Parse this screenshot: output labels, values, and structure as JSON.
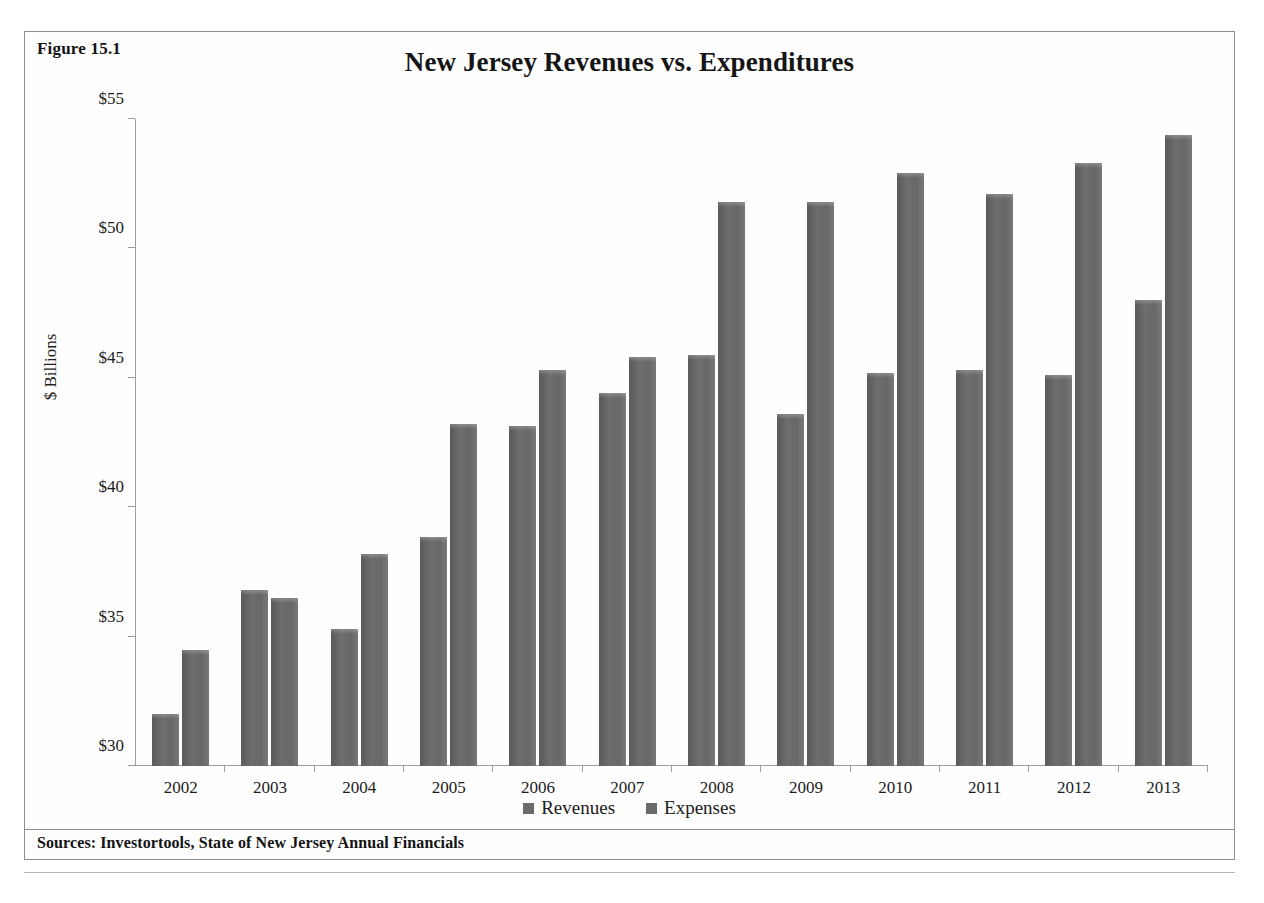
{
  "figure": {
    "label": "Figure 15.1",
    "source_note": "Sources: Investortools, State of New Jersey Annual Financials"
  },
  "chart_data": {
    "type": "bar",
    "title": "New Jersey Revenues vs. Expenditures",
    "xlabel": "",
    "ylabel": "$ Billions",
    "categories": [
      "2002",
      "2003",
      "2004",
      "2005",
      "2006",
      "2007",
      "2008",
      "2009",
      "2010",
      "2011",
      "2012",
      "2013"
    ],
    "series": [
      {
        "name": "Revenues",
        "color": "#6a6a6a",
        "values": [
          32.0,
          36.8,
          35.3,
          38.85,
          43.15,
          44.4,
          45.9,
          43.6,
          45.2,
          45.3,
          45.1,
          48.0
        ]
      },
      {
        "name": "Expenses",
        "color": "#6a6a6a",
        "values": [
          34.5,
          36.5,
          38.2,
          43.2,
          45.3,
          45.8,
          51.8,
          51.8,
          52.9,
          52.1,
          53.3,
          54.4
        ]
      }
    ],
    "ylim": [
      30,
      55
    ],
    "ytick_values": [
      30,
      35,
      40,
      45,
      50,
      55
    ],
    "ytick_labels": [
      "$30",
      "$35",
      "$40",
      "$45",
      "$50",
      "$55"
    ],
    "grid": false,
    "legend_position": "bottom"
  }
}
